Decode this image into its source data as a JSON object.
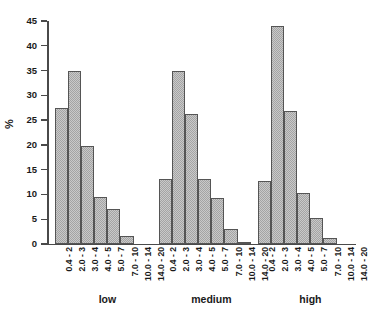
{
  "chart_data": {
    "type": "bar",
    "title": "",
    "subtitle": "",
    "xlabel": "",
    "ylabel": "%",
    "ylim": [
      0,
      45
    ],
    "yticks": [
      0,
      5,
      10,
      15,
      20,
      25,
      30,
      35,
      40,
      45
    ],
    "grid": false,
    "legend": "none",
    "categories": [
      "0.4 - 2",
      "2.0 - 3",
      "3.0 - 4",
      "4.0 - 5",
      "5.0 - 7",
      "7.0 - 10",
      "10.0 - 14",
      "14.0 - 20"
    ],
    "group_labels": [
      "low",
      "medium",
      "high"
    ],
    "series": [
      {
        "name": "low",
        "values": [
          27.5,
          35.0,
          19.8,
          9.5,
          7.0,
          1.6,
          0.0,
          0.0
        ]
      },
      {
        "name": "medium",
        "values": [
          13.2,
          35.0,
          26.3,
          13.2,
          9.2,
          3.0,
          0.4,
          0.0
        ]
      },
      {
        "name": "high",
        "values": [
          12.7,
          44.0,
          26.8,
          10.2,
          5.2,
          1.2,
          0.0,
          0.0
        ]
      }
    ],
    "colors": {
      "bar_fill": "#c9c9c9",
      "bar_hatch": "#a4a4a4",
      "bar_edge": "#555555",
      "axis": "#4a4a4a",
      "text": "#1a1a1a",
      "background": "#ffffff"
    }
  }
}
